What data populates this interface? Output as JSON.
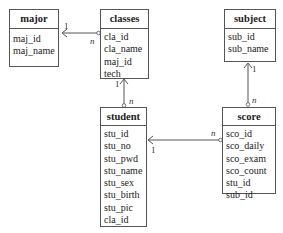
{
  "entities": {
    "major": {
      "title": "major",
      "attributes": [
        "maj_id",
        "maj_name"
      ]
    },
    "classes": {
      "title": "classes",
      "attributes": [
        "cla_id",
        "cla_name",
        "maj_id",
        "tech"
      ]
    },
    "subject": {
      "title": "subject",
      "attributes": [
        "sub_id",
        "sub_name"
      ]
    },
    "score": {
      "title": "score",
      "attributes": [
        "sco_id",
        "sco_daily",
        "sco_exam",
        "sco_count",
        "stu_id",
        "sub_id"
      ]
    },
    "student": {
      "title": "student",
      "attributes": [
        "stu_id",
        "stu_no",
        "stu_pwd",
        "stu_name",
        "stu_sex",
        "stu_birth",
        "stu_pic",
        "cla_id"
      ]
    }
  },
  "relationships": [
    {
      "from": "classes",
      "to": "major",
      "from_card": "n",
      "to_card": "1"
    },
    {
      "from": "student",
      "to": "classes",
      "from_card": "n",
      "to_card": "1"
    },
    {
      "from": "score",
      "to": "subject",
      "from_card": "n",
      "to_card": "1"
    },
    {
      "from": "score",
      "to": "student",
      "from_card": "n",
      "to_card": "1"
    }
  ]
}
